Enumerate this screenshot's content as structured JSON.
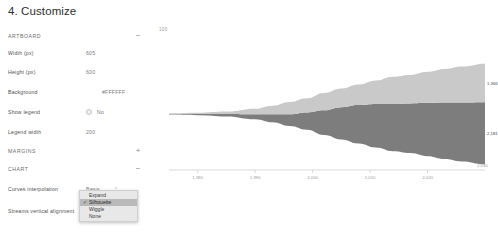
{
  "page_title": "4. Customize",
  "panel": {
    "sections": [
      {
        "id": "artboard",
        "label": "ARTBOARD",
        "toggle": "−",
        "expanded": true
      },
      {
        "id": "margins",
        "label": "MARGINS",
        "toggle": "+",
        "expanded": false
      },
      {
        "id": "chart",
        "label": "CHART",
        "toggle": "−",
        "expanded": true
      }
    ],
    "fields": [
      {
        "id": "width",
        "label": "Width (px)",
        "value": "605"
      },
      {
        "id": "height",
        "label": "Height (px)",
        "value": "600"
      },
      {
        "id": "background",
        "label": "Background",
        "value": "#FFFFFF"
      },
      {
        "id": "show_legend",
        "label": "Show legend",
        "value": "No"
      },
      {
        "id": "legend_width",
        "label": "Legend width",
        "value": "200"
      },
      {
        "id": "curves_interpolation",
        "label": "Curves interpolation",
        "value": "Basis"
      },
      {
        "id": "streams_vertical_alignment",
        "label": "Streams vertical alignment",
        "value": "Silhouette"
      }
    ],
    "select_caret": "⌃"
  },
  "dropdown": {
    "open": true,
    "check_glyph": "✓",
    "selected": "Silhouette",
    "options": [
      {
        "label": "Expand",
        "selected": false
      },
      {
        "label": "Silhouette",
        "selected": true
      },
      {
        "label": "Wiggle",
        "selected": false
      },
      {
        "label": "None",
        "selected": false
      }
    ]
  },
  "chart_data": {
    "type": "area",
    "title": "",
    "corner_label": "100",
    "xlabel": "",
    "ylabel": "",
    "offset": "silhouette",
    "curve": "basis",
    "grid": false,
    "legend": false,
    "axis_end_caption": "2,030",
    "xlim": [
      1975,
      2030
    ],
    "tick_labels": [
      "1,980",
      "1,990",
      "2,000",
      "2,010",
      "2,020"
    ],
    "ticks": [
      1980,
      1990,
      2000,
      2010,
      2020
    ],
    "x": [
      1975,
      1980,
      1985,
      1990,
      1993,
      1996,
      1999,
      2002,
      2005,
      2008,
      2011,
      2014,
      2017,
      2020,
      2023,
      2026,
      2030
    ],
    "series": [
      {
        "name": "Series A",
        "color": "#7d7d7d",
        "label": "2,181",
        "values": [
          1,
          2,
          4,
          8,
          13,
          19,
          28,
          40,
          52,
          62,
          70,
          76,
          80,
          86,
          91,
          95,
          100
        ]
      },
      {
        "name": "Series B",
        "color": "#c9c9c9",
        "label": "1,366",
        "values": [
          1,
          2,
          4,
          9,
          14,
          20,
          23,
          28,
          30,
          33,
          38,
          44,
          46,
          50,
          54,
          58,
          62
        ]
      }
    ]
  }
}
